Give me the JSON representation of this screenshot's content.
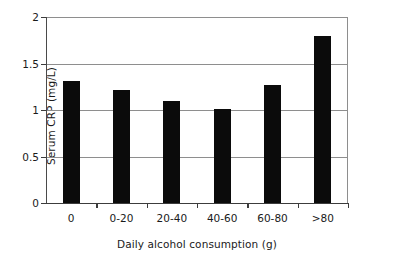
{
  "chart_data": {
    "type": "bar",
    "title": "",
    "subtitle": "",
    "xlabel": "Daily alcohol consumption (g)",
    "ylabel": "Serum CRP (mg/L)",
    "categories": [
      "0",
      "0-20",
      "20-40",
      "40-60",
      "60-80",
      ">80"
    ],
    "values": [
      1.31,
      1.21,
      1.1,
      1.01,
      1.27,
      1.8
    ],
    "ylim": [
      0,
      2
    ],
    "yticks": [
      0,
      0.5,
      1,
      1.5,
      2
    ],
    "ytick_labels": [
      "0",
      "0.5",
      "1",
      "1.5",
      "2"
    ],
    "grid": "horizontal",
    "legend": "none",
    "bar_color": "#0b0b0b",
    "gridline_color": "#8e8e8e",
    "axis_color": "#3c3c3c",
    "background_color": "#ffffff",
    "annotations": []
  }
}
